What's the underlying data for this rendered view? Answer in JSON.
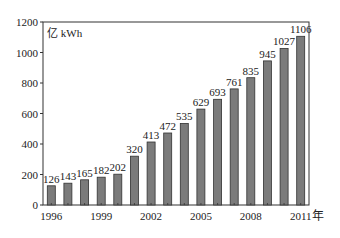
{
  "chart_data": {
    "type": "bar",
    "title": "",
    "unit_label": "亿 kWh",
    "xlabel": "年",
    "ylabel": "亿 kWh",
    "categories": [
      "1996",
      "1997",
      "1998",
      "1999",
      "2000",
      "2001",
      "2002",
      "2003",
      "2004",
      "2005",
      "2006",
      "2007",
      "2008",
      "2009",
      "2010",
      "2011"
    ],
    "values": [
      126,
      143,
      165,
      182,
      202,
      320,
      413,
      472,
      535,
      629,
      693,
      761,
      835,
      945,
      1027,
      1106
    ],
    "x_tick_labels": [
      "1996",
      "1999",
      "2002",
      "2005",
      "2008",
      "2011"
    ],
    "y_ticks": [
      0,
      200,
      400,
      600,
      800,
      1000,
      1200
    ],
    "ylim": [
      0,
      1200
    ],
    "grid": false,
    "legend": null,
    "bar_color": "#7b7b7b",
    "bar_edge_color": "#333333",
    "data_labels": true
  }
}
